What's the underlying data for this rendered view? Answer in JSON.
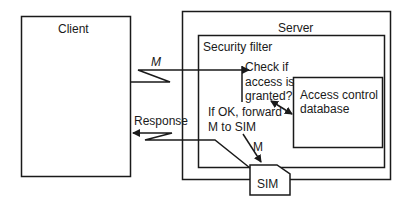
{
  "diagram": {
    "nodes": {
      "client": {
        "label": "Client"
      },
      "server": {
        "label": "Server"
      },
      "security_filter": {
        "label": "Security filter"
      },
      "access_db": {
        "line1": "Access control",
        "line2": "database"
      },
      "sim": {
        "label": "SIM"
      }
    },
    "annotations": {
      "check": {
        "line1": "Check if",
        "line2": "access is",
        "line3": "granted?"
      },
      "forward": {
        "line1": "If OK, forward",
        "line2": "M to SIM"
      }
    },
    "edges": {
      "request": {
        "label": "M"
      },
      "to_sim": {
        "label": "M"
      },
      "response": {
        "label": "Response"
      }
    },
    "colors": {
      "stroke": "#1a1a1a",
      "background": "#ffffff"
    }
  }
}
